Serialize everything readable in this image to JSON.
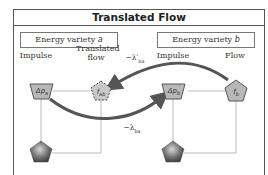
{
  "title": "Translated Flow",
  "varieties": {
    "a": {
      "label": "Energy variety ",
      "var": "a"
    },
    "b": {
      "label": "Energy variety ",
      "var": "b"
    }
  },
  "labels": {
    "impulse_a": "Impulse",
    "translated_flow": "Translated flow",
    "impulse_b": "Impulse",
    "flow_b": "Flow"
  },
  "nodes": {
    "dp_a": "Δp",
    "dp_a_sub": "a",
    "f_ab": "f",
    "f_ab_sub": "ab",
    "dp_b": "Δp",
    "dp_b_sub": "b",
    "f_b": "f",
    "f_b_sub": "b"
  },
  "edges": {
    "upper": "−λ′",
    "upper_sub": "ba",
    "lower": "−λ",
    "lower_sub": "ba"
  },
  "colors": {
    "node_fill": "#b8b8b8",
    "arrow": "#555555",
    "wire": "#bbbbbb",
    "frame": "#555555"
  }
}
